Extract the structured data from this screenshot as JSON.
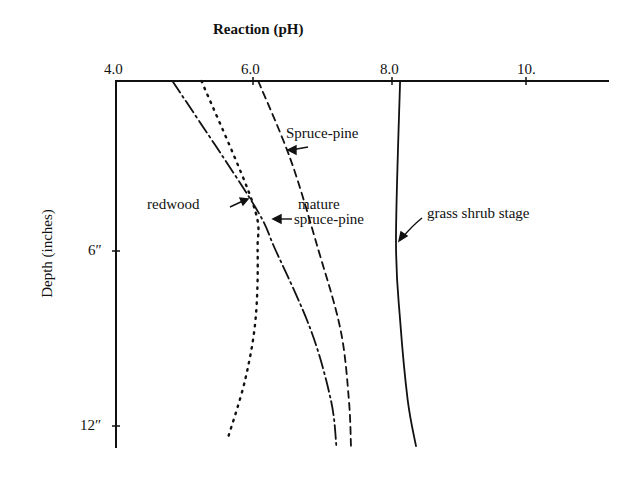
{
  "chart_data": {
    "type": "line",
    "title": "Reaction (pH)",
    "xlabel": "Reaction (pH)",
    "ylabel": "Depth (inches)",
    "x_axis_position": "top",
    "y_axis_inverted": true,
    "xlim": [
      4.0,
      11.0
    ],
    "ylim": [
      0,
      13
    ],
    "x_ticks": [
      {
        "value": 4.0,
        "label": "4.0"
      },
      {
        "value": 6.0,
        "label": "6.0"
      },
      {
        "value": 8.0,
        "label": "8.0"
      },
      {
        "value": 10.0,
        "label": "10."
      }
    ],
    "y_ticks": [
      {
        "value": 6,
        "label": "6″"
      },
      {
        "value": 12,
        "label": "12″"
      }
    ],
    "grid": false,
    "legend": "inline annotations with arrows",
    "series": [
      {
        "name": "mature spruce-pine",
        "style": "dash-dot",
        "points": [
          [
            4.83,
            0
          ],
          [
            5.99,
            4.24
          ],
          [
            6.32,
            5.88
          ],
          [
            6.83,
            8.66
          ],
          [
            7.12,
            11.1
          ],
          [
            7.2,
            12.7
          ]
        ]
      },
      {
        "name": "redwood",
        "style": "dotted",
        "points": [
          [
            5.25,
            0
          ],
          [
            5.99,
            4.24
          ],
          [
            6.06,
            5.88
          ],
          [
            6.03,
            8.31
          ],
          [
            5.88,
            10.4
          ],
          [
            5.64,
            12.35
          ]
        ]
      },
      {
        "name": "Spruce-pine",
        "style": "dashed",
        "points": [
          [
            6.07,
            0
          ],
          [
            6.54,
            2.75
          ],
          [
            6.94,
            5.88
          ],
          [
            7.26,
            8.66
          ],
          [
            7.38,
            11.1
          ],
          [
            7.41,
            12.7
          ]
        ]
      },
      {
        "name": "grass shrub stage",
        "style": "solid",
        "points": [
          [
            8.12,
            0
          ],
          [
            8.06,
            5.53
          ],
          [
            8.12,
            8.31
          ],
          [
            8.23,
            11.1
          ],
          [
            8.35,
            12.7
          ]
        ]
      }
    ],
    "annotations": [
      {
        "text": "Spruce-pine",
        "target_series": "Spruce-pine"
      },
      {
        "text": "redwood",
        "target_series": "redwood"
      },
      {
        "text": "mature",
        "target_series": "mature spruce-pine"
      },
      {
        "text": "spruce-pine",
        "target_series": "mature spruce-pine"
      },
      {
        "text": "grass shrub stage",
        "target_series": "grass shrub stage"
      }
    ]
  },
  "labels": {
    "title": "Reaction (pH)",
    "y_axis": "Depth   (inches)",
    "x_tick_0": "4.0",
    "x_tick_1": "6.0",
    "x_tick_2": "8.0",
    "x_tick_3": "10.",
    "y_tick_0": "6″",
    "y_tick_1": "12″",
    "ann_spruce_pine": "Spruce-pine",
    "ann_redwood": "redwood",
    "ann_mature_1": "mature",
    "ann_mature_2": "spruce-pine",
    "ann_grass": "grass shrub stage"
  },
  "colors": {
    "ink": "#111111",
    "background": "#ffffff"
  }
}
